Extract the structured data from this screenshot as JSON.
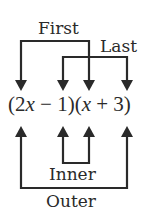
{
  "diagram": {
    "type": "FOIL method",
    "expression": {
      "open1": "(",
      "term_a": "2",
      "var1": "x",
      "op1": " − 1)(",
      "var2": "x",
      "op2": " + 3)"
    },
    "labels": {
      "first": "First",
      "last": "Last",
      "inner": "Inner",
      "outer": "Outer"
    },
    "connectors": [
      {
        "name": "First",
        "from": "2x",
        "to": "x",
        "direction": "down"
      },
      {
        "name": "Last",
        "from": "-1",
        "to": "+3",
        "direction": "down"
      },
      {
        "name": "Inner",
        "from": "-1",
        "to": "x",
        "direction": "up"
      },
      {
        "name": "Outer",
        "from": "2x",
        "to": "+3",
        "direction": "up"
      }
    ],
    "colors": {
      "line": "#2a2a2a",
      "background": "#ffffff"
    }
  }
}
